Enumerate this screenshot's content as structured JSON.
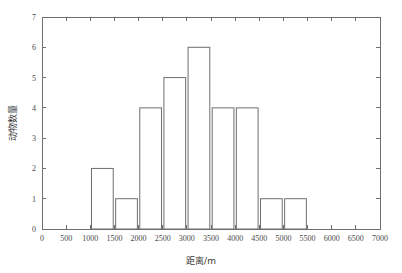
{
  "chart_data": {
    "type": "bar",
    "title": "",
    "subtitle": "",
    "xlabel": "距离/m",
    "ylabel": "动物数量",
    "xlim": [
      0,
      7000
    ],
    "ylim": [
      0,
      7
    ],
    "bin_width": 500,
    "grid": false,
    "legend": "none",
    "bar_style": {
      "fill": "#ffffff",
      "edge": "#6e6e6e",
      "edge_width": 1
    },
    "axis_color": "#6e6e6e",
    "xticks": [
      0,
      500,
      1000,
      1500,
      2000,
      2500,
      3000,
      3500,
      4000,
      4500,
      5000,
      5500,
      6000,
      6500,
      7000
    ],
    "xtick_labels": [
      "0",
      "500",
      "1000",
      "1500",
      "2000",
      "2500",
      "3000",
      "3500",
      "4000",
      "4500",
      "5000",
      "5500",
      "6000",
      "6500",
      "7000"
    ],
    "yticks": [
      0,
      1,
      2,
      3,
      4,
      5,
      6,
      7
    ],
    "ytick_labels": [
      "0",
      "1",
      "2",
      "3",
      "4",
      "5",
      "6",
      "7"
    ],
    "bins": [
      {
        "start": 0,
        "end": 500,
        "value": 0
      },
      {
        "start": 500,
        "end": 1000,
        "value": 0
      },
      {
        "start": 1000,
        "end": 1500,
        "value": 2
      },
      {
        "start": 1500,
        "end": 2000,
        "value": 1
      },
      {
        "start": 2000,
        "end": 2500,
        "value": 4
      },
      {
        "start": 2500,
        "end": 3000,
        "value": 5
      },
      {
        "start": 3000,
        "end": 3500,
        "value": 6
      },
      {
        "start": 3500,
        "end": 4000,
        "value": 4
      },
      {
        "start": 4000,
        "end": 4500,
        "value": 4
      },
      {
        "start": 4500,
        "end": 5000,
        "value": 1
      },
      {
        "start": 5000,
        "end": 5500,
        "value": 1
      },
      {
        "start": 5500,
        "end": 6000,
        "value": 0
      },
      {
        "start": 6000,
        "end": 6500,
        "value": 0
      },
      {
        "start": 6500,
        "end": 7000,
        "value": 0
      }
    ],
    "categories": [
      "0-500",
      "500-1000",
      "1000-1500",
      "1500-2000",
      "2000-2500",
      "2500-3000",
      "3000-3500",
      "3500-4000",
      "4000-4500",
      "4500-5000",
      "5000-5500",
      "5500-6000",
      "6000-6500",
      "6500-7000"
    ],
    "values": [
      0,
      0,
      2,
      1,
      4,
      5,
      6,
      4,
      4,
      1,
      1,
      0,
      0,
      0
    ]
  }
}
